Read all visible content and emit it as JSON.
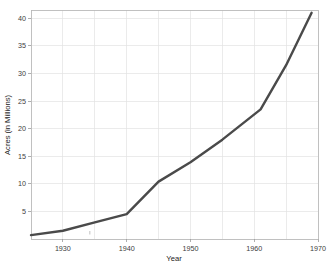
{
  "chart_data": {
    "type": "line",
    "title": "",
    "xlabel": "Year",
    "ylabel": "Acres (in Millions)",
    "xlim": [
      1925,
      1970
    ],
    "ylim": [
      0,
      41.5
    ],
    "grid": true,
    "legend": null,
    "line_color": "#4a4a4a",
    "x_ticks": [
      1930,
      1940,
      1950,
      1960,
      1970
    ],
    "x_tick_labels": [
      "1930",
      "1940",
      "1950",
      "1960",
      "1970"
    ],
    "x_gridlines": [
      1925,
      1930,
      1935,
      1940,
      1945,
      1950,
      1955,
      1960,
      1965,
      1970
    ],
    "y_ticks": [
      5,
      10,
      15,
      20,
      25,
      30,
      35,
      40
    ],
    "y_tick_labels": [
      "5",
      "10",
      "15",
      "20",
      "25",
      "30",
      "35",
      "40"
    ],
    "series": [
      {
        "name": "Acres",
        "x": [
          1925,
          1930,
          1935,
          1940,
          1945,
          1950,
          1955,
          1961,
          1965,
          1969
        ],
        "values": [
          0.7,
          1.5,
          3.0,
          4.5,
          10.4,
          13.9,
          18.0,
          23.5,
          31.5,
          41.0
        ]
      }
    ]
  }
}
